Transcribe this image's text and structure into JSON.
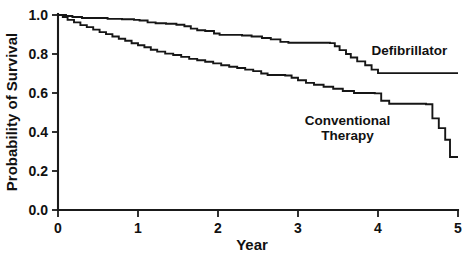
{
  "chart_data": {
    "type": "line",
    "subtype": "kaplan-meier-step",
    "title": "",
    "xlabel": "Year",
    "ylabel": "Probability of Survival",
    "xlim": [
      0,
      5
    ],
    "ylim": [
      0,
      1
    ],
    "xticks": [
      0,
      1,
      2,
      3,
      4,
      5
    ],
    "xtick_labels": [
      "0",
      "1",
      "2",
      "3",
      "4",
      "5"
    ],
    "yticks": [
      0.0,
      0.2,
      0.4,
      0.6,
      0.8,
      1.0
    ],
    "ytick_labels": [
      "0.0",
      "0.2",
      "0.4",
      "0.6",
      "0.8",
      "1.0"
    ],
    "grid": false,
    "legend_position": "inline-right-of-curves",
    "series": [
      {
        "name": "Defibrillator",
        "label": "Defibrillator",
        "label_x": 3.92,
        "label_y": 0.795,
        "label_anchor": "start",
        "color": "#161616",
        "final_value": 0.7,
        "points": [
          [
            0.0,
            1.0
          ],
          [
            0.1,
            0.995
          ],
          [
            0.18,
            0.99
          ],
          [
            0.3,
            0.985
          ],
          [
            0.55,
            0.985
          ],
          [
            0.62,
            0.98
          ],
          [
            0.8,
            0.978
          ],
          [
            0.95,
            0.975
          ],
          [
            1.02,
            0.972
          ],
          [
            1.12,
            0.962
          ],
          [
            1.22,
            0.958
          ],
          [
            1.35,
            0.955
          ],
          [
            1.48,
            0.95
          ],
          [
            1.58,
            0.942
          ],
          [
            1.66,
            0.93
          ],
          [
            1.74,
            0.922
          ],
          [
            1.84,
            0.918
          ],
          [
            1.95,
            0.905
          ],
          [
            2.02,
            0.898
          ],
          [
            2.3,
            0.895
          ],
          [
            2.42,
            0.89
          ],
          [
            2.55,
            0.882
          ],
          [
            2.66,
            0.875
          ],
          [
            2.78,
            0.862
          ],
          [
            2.88,
            0.858
          ],
          [
            3.4,
            0.856
          ],
          [
            3.46,
            0.84
          ],
          [
            3.52,
            0.82
          ],
          [
            3.6,
            0.8
          ],
          [
            3.66,
            0.782
          ],
          [
            3.74,
            0.762
          ],
          [
            3.84,
            0.742
          ],
          [
            3.92,
            0.72
          ],
          [
            4.0,
            0.702
          ],
          [
            5.0,
            0.702
          ]
        ]
      },
      {
        "name": "Conventional Therapy",
        "label_line1": "Conventional",
        "label_line2": "Therapy",
        "label_x": 3.62,
        "label_y": 0.435,
        "label_anchor": "middle",
        "color": "#161616",
        "final_value": 0.27,
        "points": [
          [
            0.0,
            1.0
          ],
          [
            0.06,
            0.99
          ],
          [
            0.12,
            0.975
          ],
          [
            0.2,
            0.962
          ],
          [
            0.28,
            0.948
          ],
          [
            0.36,
            0.938
          ],
          [
            0.44,
            0.925
          ],
          [
            0.52,
            0.912
          ],
          [
            0.6,
            0.902
          ],
          [
            0.68,
            0.89
          ],
          [
            0.76,
            0.878
          ],
          [
            0.84,
            0.868
          ],
          [
            0.92,
            0.855
          ],
          [
            1.0,
            0.845
          ],
          [
            1.08,
            0.835
          ],
          [
            1.16,
            0.822
          ],
          [
            1.24,
            0.812
          ],
          [
            1.34,
            0.802
          ],
          [
            1.44,
            0.795
          ],
          [
            1.54,
            0.785
          ],
          [
            1.64,
            0.775
          ],
          [
            1.74,
            0.768
          ],
          [
            1.84,
            0.76
          ],
          [
            1.94,
            0.752
          ],
          [
            2.04,
            0.742
          ],
          [
            2.14,
            0.735
          ],
          [
            2.24,
            0.728
          ],
          [
            2.34,
            0.72
          ],
          [
            2.44,
            0.712
          ],
          [
            2.54,
            0.7
          ],
          [
            2.62,
            0.692
          ],
          [
            2.84,
            0.69
          ],
          [
            2.92,
            0.678
          ],
          [
            3.0,
            0.665
          ],
          [
            3.1,
            0.652
          ],
          [
            3.2,
            0.642
          ],
          [
            3.32,
            0.632
          ],
          [
            3.44,
            0.622
          ],
          [
            3.56,
            0.61
          ],
          [
            3.7,
            0.6
          ],
          [
            3.96,
            0.598
          ],
          [
            4.04,
            0.56
          ],
          [
            4.14,
            0.545
          ],
          [
            4.6,
            0.542
          ],
          [
            4.68,
            0.47
          ],
          [
            4.76,
            0.42
          ],
          [
            4.84,
            0.36
          ],
          [
            4.9,
            0.272
          ],
          [
            5.0,
            0.272
          ]
        ]
      }
    ]
  },
  "axes": {
    "x_title": "Year",
    "y_title": "Probability of Survival"
  }
}
